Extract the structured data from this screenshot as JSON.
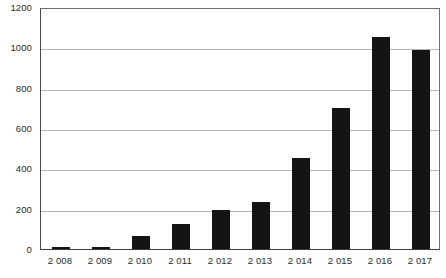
{
  "chart_data": {
    "type": "bar",
    "title": "",
    "subtitle": "",
    "xlabel": "",
    "ylabel": "",
    "categories": [
      "2 008",
      "2 009",
      "2 010",
      "2 011",
      "2 012",
      "2 013",
      "2 014",
      "2 015",
      "2 016",
      "2 017"
    ],
    "values": [
      5,
      8,
      65,
      125,
      195,
      235,
      450,
      700,
      1050,
      985
    ],
    "ylim": [
      0,
      1200
    ],
    "ytick_labels": [
      "0",
      "200",
      "400",
      "600",
      "800",
      "1000",
      "1200"
    ],
    "ytick_values": [
      0,
      200,
      400,
      600,
      800,
      1000,
      1200
    ],
    "grid": "horizontal",
    "legend": "none",
    "series": [
      {
        "name": "",
        "color": "#141414",
        "values": [
          5,
          8,
          65,
          125,
          195,
          235,
          450,
          700,
          1050,
          985
        ]
      }
    ],
    "colors": {
      "bar": "#141414",
      "gridline": "#b4b4b4",
      "axis": "#3a3a3a",
      "plot_background": "#ffffff",
      "label_text": "#2b2b2b"
    }
  }
}
